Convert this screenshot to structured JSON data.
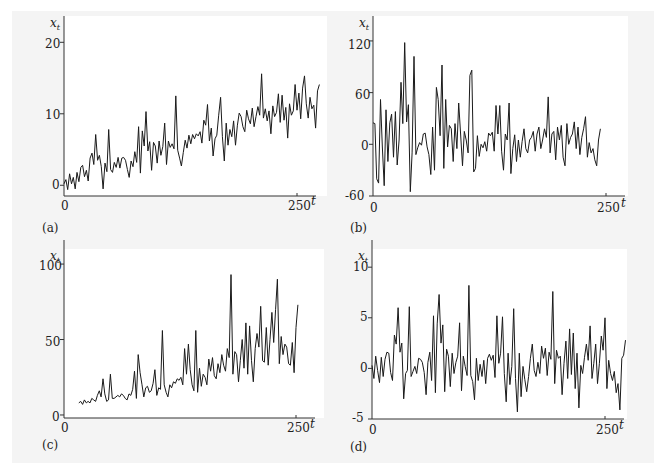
{
  "figure": {
    "panels": [
      {
        "id": "a",
        "label": "(a)",
        "ylabel": "x_t",
        "ylabel_main": "x",
        "ylabel_sub": "t",
        "xlabel": "t",
        "yticks": [
          "0",
          "10",
          "20"
        ],
        "xticks": [
          "0",
          "250"
        ]
      },
      {
        "id": "b",
        "label": "(b)",
        "ylabel": "x_t",
        "ylabel_main": "x",
        "ylabel_sub": "t",
        "xlabel": "t",
        "yticks": [
          "-60",
          "0",
          "60",
          "120"
        ],
        "xticks": [
          "0",
          "250"
        ]
      },
      {
        "id": "c",
        "label": "(c)",
        "ylabel": "x_t",
        "ylabel_main": "x",
        "ylabel_sub": "t",
        "xlabel": "t",
        "yticks": [
          "0",
          "50",
          "100"
        ],
        "xticks": [
          "0",
          "250"
        ]
      },
      {
        "id": "d",
        "label": "(d)",
        "ylabel": "x_t",
        "ylabel_main": "x",
        "ylabel_sub": "t",
        "xlabel": "t",
        "yticks": [
          "-5",
          "0",
          "5",
          "10"
        ],
        "xticks": [
          "0",
          "250"
        ]
      }
    ],
    "line_color": "#1a1a1a",
    "background": "#f4f4f4",
    "plot_background": "#ffffff"
  },
  "chart_data": [
    {
      "type": "line",
      "title": "(a)",
      "xlabel": "t",
      "ylabel": "x_t",
      "xlim": [
        0,
        270
      ],
      "ylim": [
        -1.5,
        22
      ],
      "yticks": [
        0,
        10,
        20
      ],
      "xticks": [
        0,
        250
      ],
      "grid": false,
      "x_step": 2,
      "x_start": 0,
      "values": [
        0.2,
        0.8,
        -0.6,
        1.6,
        0.2,
        1.1,
        -0.5,
        1.8,
        0.5,
        2.5,
        2.8,
        1.2,
        2.1,
        0.6,
        3.8,
        4.5,
        2.9,
        7.1,
        3.5,
        4.2,
        2.6,
        -0.5,
        3.1,
        1.9,
        7.8,
        2.2,
        1.8,
        3.2,
        2.5,
        3.9,
        2.4,
        3.8,
        3.9,
        3.5,
        2.2,
        1.1,
        3.4,
        2.6,
        4.7,
        3.2,
        8.2,
        1.7,
        7.6,
        5.5,
        10.3,
        4.8,
        6.1,
        2.1,
        6.0,
        5.5,
        3.1,
        6.2,
        4.2,
        5.4,
        8.7,
        2.9,
        6.2,
        5.3,
        5.8,
        5.1,
        12.5,
        4.9,
        3.8,
        2.7,
        4.6,
        6.3,
        5.2,
        7.0,
        5.8,
        7.1,
        6.5,
        7.2,
        6.9,
        7.5,
        5.9,
        9.1,
        8.4,
        11.3,
        6.2,
        8.0,
        4.1,
        6.5,
        7.0,
        9.8,
        12.3,
        6.8,
        3.4,
        8.7,
        5.6,
        7.8,
        6.8,
        9.0,
        5.6,
        8.4,
        10.1,
        9.6,
        8.2,
        7.5,
        10.5,
        9.3,
        8.6,
        10.8,
        8.2,
        9.6,
        11.0,
        9.8,
        15.6,
        9.4,
        10.7,
        9.0,
        10.4,
        7.2,
        11.1,
        9.6,
        10.2,
        12.8,
        8.8,
        12.6,
        9.1,
        10.9,
        6.6,
        11.4,
        9.8,
        10.4,
        14.1,
        10.5,
        12.9,
        9.3,
        13.6,
        15.3,
        11.4,
        9.4,
        12.3,
        10.7,
        11.2,
        8.0,
        13.2,
        14.1
      ]
    },
    {
      "type": "line",
      "title": "(b)",
      "xlabel": "t",
      "ylabel": "x_t",
      "xlim": [
        0,
        270
      ],
      "ylim": [
        -60,
        135
      ],
      "yticks": [
        -60,
        0,
        60,
        120
      ],
      "xticks": [
        0,
        250
      ],
      "grid": false,
      "x_step": 2,
      "x_start": 0,
      "values": [
        25,
        24,
        -40,
        -45,
        52,
        -2,
        -48,
        40,
        -20,
        25,
        35,
        -15,
        38,
        -24,
        5,
        72,
        24,
        118,
        26,
        46,
        -55,
        -10,
        102,
        -12,
        -4,
        2,
        -1,
        12,
        13,
        -3,
        -12,
        -35,
        20,
        -30,
        66,
        52,
        10,
        92,
        -28,
        52,
        -3,
        22,
        18,
        -20,
        24,
        -5,
        48,
        12,
        -25,
        15,
        5,
        -10,
        80,
        86,
        -32,
        -28,
        10,
        -14,
        0,
        -4,
        3,
        -8,
        13,
        10,
        14,
        -8,
        45,
        12,
        45,
        -8,
        -30,
        12,
        5,
        48,
        -34,
        -5,
        11,
        -20,
        5,
        -15,
        3,
        18,
        -5,
        -10,
        5,
        8,
        15,
        -8,
        12,
        20,
        -5,
        5,
        18,
        8,
        55,
        -10,
        12,
        15,
        -18,
        20,
        5,
        22,
        -15,
        -25,
        24,
        0,
        8,
        12,
        26,
        -5,
        20,
        -12,
        8,
        18,
        32,
        -15,
        2,
        -10,
        -5,
        -18,
        -25,
        5,
        18
      ]
    },
    {
      "type": "line",
      "title": "(c)",
      "xlabel": "t",
      "ylabel": "x_t",
      "xlim": [
        0,
        270
      ],
      "ylim": [
        -2,
        108
      ],
      "yticks": [
        0,
        50,
        100
      ],
      "xticks": [
        0,
        250
      ],
      "grid": false,
      "x_step": 2,
      "x_start": 16,
      "values": [
        8,
        9,
        7,
        10,
        8,
        9,
        8,
        11,
        10,
        9,
        13,
        16,
        12,
        24,
        14,
        9,
        10,
        27,
        11,
        11,
        12,
        13,
        12,
        14,
        13,
        11,
        10,
        14,
        13,
        17,
        29,
        11,
        40,
        28,
        20,
        12,
        18,
        19,
        15,
        16,
        21,
        30,
        13,
        18,
        17,
        56,
        20,
        15,
        12,
        20,
        18,
        22,
        21,
        24,
        23,
        25,
        20,
        44,
        27,
        47,
        30,
        20,
        16,
        56,
        15,
        31,
        19,
        27,
        25,
        20,
        37,
        29,
        38,
        26,
        24,
        34,
        28,
        40,
        33,
        29,
        44,
        38,
        93,
        27,
        42,
        40,
        22,
        36,
        50,
        31,
        61,
        27,
        59,
        36,
        22,
        44,
        54,
        45,
        72,
        36,
        35,
        58,
        33,
        50,
        68,
        48,
        70,
        90,
        34,
        52,
        40,
        47,
        45,
        34,
        33,
        48,
        28,
        58,
        73
      ]
    },
    {
      "type": "line",
      "title": "(d)",
      "xlabel": "t",
      "ylabel": "x_t",
      "xlim": [
        0,
        270
      ],
      "ylim": [
        -5,
        11.5
      ],
      "yticks": [
        -5,
        0,
        5,
        10
      ],
      "xticks": [
        0,
        250
      ],
      "grid": false,
      "x_step": 2,
      "x_start": 0,
      "values": [
        0.3,
        -1.0,
        1.2,
        -0.2,
        -1.4,
        1.1,
        -0.8,
        0.9,
        1.6,
        1.5,
        -0.4,
        -1.2,
        3.3,
        2.4,
        6.0,
        1.6,
        2.5,
        -3.0,
        -0.5,
        -0.2,
        6.1,
        -0.8,
        -0.3,
        0.2,
        -0.5,
        1.0,
        0.9,
        0.6,
        -0.4,
        -2.6,
        0.6,
        1.6,
        -1.2,
        5.2,
        -2.4,
        4.4,
        7.3,
        2.5,
        4.3,
        -2.3,
        1.9,
        1.2,
        -1.8,
        1.5,
        -0.5,
        0.6,
        1.2,
        4.5,
        -2.2,
        1.2,
        0.2,
        -0.7,
        8.2,
        -0.7,
        -1.3,
        -3.1,
        1.0,
        -1.2,
        0.4,
        -0.8,
        0.8,
        -1.5,
        1.0,
        1.4,
        0.8,
        1.3,
        -0.9,
        5.2,
        0.5,
        1.5,
        5.1,
        -0.5,
        -3.3,
        1.5,
        -1.6,
        0.2,
        5.9,
        -1.0,
        -4.3,
        1.5,
        -2.8,
        0.2,
        -1.1,
        -2.3,
        -0.8,
        1.0,
        2.4,
        -0.2,
        -0.8,
        0.6,
        -0.5,
        2.2,
        1.0,
        2.0,
        -0.7,
        1.6,
        0.9,
        7.6,
        -1.5,
        1.8,
        1.0,
        1.2,
        -2.6,
        0.5,
        2.7,
        -1.0,
        3.9,
        -0.6,
        3.5,
        -2.0,
        1.5,
        -3.9,
        0.3,
        -0.5,
        1.1,
        2.4,
        0.8,
        4.2,
        -1.0,
        0.5,
        2.4,
        -1.5,
        0.5,
        3.2,
        1.8,
        5.0,
        -2.0,
        0.8,
        -0.5,
        -1.2,
        -0.3,
        -2.4,
        -1.5,
        -4.1,
        1.0,
        1.3,
        2.8
      ]
    }
  ]
}
